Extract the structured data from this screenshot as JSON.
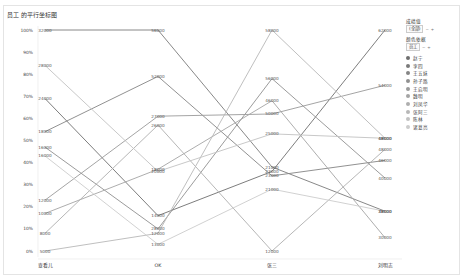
{
  "chart_data": {
    "type": "parallel-coordinates",
    "title": "员工 的平行坐标图",
    "axes": [
      "查看儿",
      "OK",
      "张三",
      "刘明志"
    ],
    "yticks": [
      "100%",
      "90%",
      "80%",
      "70%",
      "60%",
      "50%",
      "40%",
      "30%",
      "20%",
      "10%",
      "0%"
    ],
    "ylim": [
      0,
      100
    ],
    "series": [
      {
        "name": "赵宁",
        "color": "#6e6e6e",
        "values": [
          24000,
          14000,
          23000,
          62000
        ],
        "pct": [
          69,
          16,
          36,
          100
        ]
      },
      {
        "name": "李四",
        "color": "#7a7a7a",
        "values": [
          32000,
          56000,
          21000,
          38000
        ],
        "pct": [
          100,
          100,
          38,
          18
        ]
      },
      {
        "name": "王五妹",
        "color": "#858585",
        "values": [
          18000,
          52000,
          23000,
          46000
        ],
        "pct": [
          54,
          79,
          34,
          41
        ]
      },
      {
        "name": "孙子路",
        "color": "#909090",
        "values": [
          16000,
          28000,
          56000,
          40000
        ],
        "pct": [
          47,
          10,
          78,
          33
        ]
      },
      {
        "name": "王启明",
        "color": "#9a9a9a",
        "values": [
          12000,
          27000,
          50000,
          54000
        ],
        "pct": [
          23,
          61,
          62,
          75
        ]
      },
      {
        "name": "魏明",
        "color": "#a4a4a4",
        "values": [
          10000,
          18000,
          46000,
          30000
        ],
        "pct": [
          17,
          37,
          68,
          6
        ]
      },
      {
        "name": "刘凤华",
        "color": "#aeaeae",
        "values": [
          8000,
          26000,
          12000,
          48000
        ],
        "pct": [
          8,
          57,
          0,
          46
        ]
      },
      {
        "name": "张阿三",
        "color": "#b8b8b8",
        "values": [
          5000,
          12000,
          58000,
          48000
        ],
        "pct": [
          0,
          8,
          100,
          51
        ]
      },
      {
        "name": "陈林",
        "color": "#c2c2c2",
        "values": [
          28000,
          20000,
          25000,
          48000
        ],
        "pct": [
          84,
          36,
          53,
          51
        ]
      },
      {
        "name": "诸葛亮",
        "color": "#cccccc",
        "values": [
          16000,
          13000,
          21000,
          38000
        ],
        "pct": [
          43,
          3,
          28,
          18
        ]
      }
    ],
    "point_labels": [
      [
        "24000",
        "14000",
        "23000",
        "62000"
      ],
      [
        "32000",
        "56000",
        "21000",
        "38000"
      ],
      [
        "18000",
        "52000",
        "23000",
        "46000"
      ],
      [
        "16000",
        "28000",
        "56000",
        "40000"
      ],
      [
        "12000",
        "27000",
        "50000",
        "54000"
      ],
      [
        "10000",
        "18000",
        "46000",
        "30000"
      ],
      [
        "8000",
        "26000",
        "12000",
        "48000"
      ],
      [
        "5000",
        "12000",
        "58000",
        "48000"
      ],
      [
        "28000",
        "20000",
        "25000",
        "48000"
      ],
      [
        "16000",
        "13000",
        "21000",
        "38000"
      ]
    ],
    "grid": false,
    "legend_position": "right"
  },
  "legend": {
    "filter_label": "成绩值",
    "filter_value": "(全部)",
    "color_label": "颜色依据",
    "color_value": "员工",
    "btn_minus": "−",
    "btn_plus": "+"
  }
}
